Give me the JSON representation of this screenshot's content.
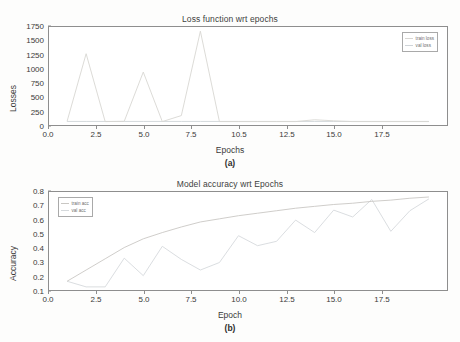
{
  "figures": [
    {
      "id": "a",
      "title": "Loss function wrt epochs",
      "xlabel": "Epochs",
      "ylabel": "Losses",
      "caption": "(a)",
      "legend": [
        {
          "label": "train loss",
          "color": "#d8d6d2"
        },
        {
          "label": "val loss",
          "color": "#cfd4d8"
        }
      ]
    },
    {
      "id": "b",
      "title": "Model accuracy wrt Epochs",
      "xlabel": "Epoch",
      "ylabel": "Accuracy",
      "caption": "(b)",
      "legend": [
        {
          "label": "train acc",
          "color": "#c9c7c3"
        },
        {
          "label": "val acc",
          "color": "#d5d9dc"
        }
      ]
    }
  ],
  "chart_data": [
    {
      "type": "line",
      "title": "Loss function wrt epochs",
      "xlabel": "Epochs",
      "ylabel": "Losses",
      "caption": "(a)",
      "xlim": [
        -0.95,
        19.95
      ],
      "ylim": [
        -60,
        1810
      ],
      "xticks": [
        "0.0",
        "2.5",
        "5.0",
        "7.5",
        "10.5",
        "12.5",
        "15.0",
        "17.5"
      ],
      "xtick_values": [
        0.0,
        2.5,
        5.0,
        7.5,
        10.0,
        12.5,
        15.0,
        17.5
      ],
      "yticks": [
        "0",
        "250",
        "500",
        "750",
        "1000",
        "1250",
        "1500",
        "1750"
      ],
      "ytick_values": [
        0,
        250,
        500,
        750,
        1000,
        1250,
        1500,
        1750
      ],
      "grid": false,
      "legend_position": "upper right",
      "x": [
        0,
        1,
        2,
        3,
        4,
        5,
        6,
        7,
        8,
        9,
        10,
        11,
        12,
        13,
        14,
        15,
        16,
        17,
        18,
        19
      ],
      "series": [
        {
          "name": "train loss",
          "color": "#d8d6d2",
          "values": [
            10,
            1300,
            5,
            10,
            950,
            5,
            120,
            1730,
            5,
            5,
            5,
            5,
            5,
            40,
            20,
            5,
            5,
            5,
            5,
            5
          ]
        },
        {
          "name": "val loss",
          "color": "#cfd4d8",
          "values": [
            8,
            8,
            8,
            8,
            8,
            8,
            8,
            8,
            8,
            8,
            8,
            8,
            8,
            8,
            8,
            8,
            8,
            8,
            8,
            8
          ]
        }
      ]
    },
    {
      "type": "line",
      "title": "Model accuracy wrt Epochs",
      "xlabel": "Epoch",
      "ylabel": "Accuracy",
      "caption": "(b)",
      "xlim": [
        -0.95,
        19.95
      ],
      "ylim": [
        0.03,
        0.815
      ],
      "xticks": [
        "0.0",
        "2.5",
        "5.0",
        "7.5",
        "10.0",
        "12.5",
        "15.0",
        "17.5"
      ],
      "xtick_values": [
        0.0,
        2.5,
        5.0,
        7.5,
        10.0,
        12.5,
        15.0,
        17.5
      ],
      "yticks": [
        "0.1",
        "0.2",
        "0.3",
        "0.4",
        "0.5",
        "0.6",
        "0.7",
        "0.8"
      ],
      "ytick_values": [
        0.1,
        0.2,
        0.3,
        0.4,
        0.5,
        0.6,
        0.7,
        0.8
      ],
      "grid": false,
      "legend_position": "upper left",
      "x": [
        0,
        1,
        2,
        3,
        4,
        5,
        6,
        7,
        8,
        9,
        10,
        11,
        12,
        13,
        14,
        15,
        16,
        17,
        18,
        19
      ],
      "series": [
        {
          "name": "train acc",
          "color": "#c9c7c3",
          "values": [
            0.1,
            0.19,
            0.28,
            0.37,
            0.44,
            0.49,
            0.535,
            0.575,
            0.6,
            0.625,
            0.645,
            0.665,
            0.685,
            0.7,
            0.715,
            0.725,
            0.74,
            0.75,
            0.765,
            0.775
          ]
        },
        {
          "name": "val acc",
          "color": "#d5d9dc",
          "values": [
            0.1,
            0.055,
            0.055,
            0.285,
            0.145,
            0.38,
            0.275,
            0.19,
            0.25,
            0.465,
            0.385,
            0.42,
            0.59,
            0.49,
            0.67,
            0.615,
            0.755,
            0.5,
            0.665,
            0.76
          ]
        }
      ]
    }
  ]
}
